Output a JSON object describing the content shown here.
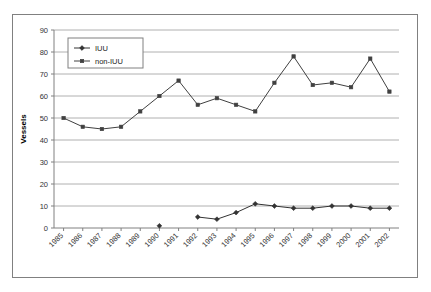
{
  "chart_data": {
    "type": "line",
    "title": "",
    "xlabel": "",
    "ylabel": "Vessels",
    "ylim": [
      0,
      90
    ],
    "ytick_step": 10,
    "yticks": [
      "0",
      "10",
      "20",
      "30",
      "40",
      "50",
      "60",
      "70",
      "80",
      "90"
    ],
    "grid": true,
    "grid_axis": "y",
    "legend_position": "top-left-inside",
    "categories": [
      "1985",
      "1986",
      "1987",
      "1988",
      "1989",
      "1990",
      "1991",
      "1992",
      "1993",
      "1994",
      "1995",
      "1996",
      "1997",
      "1998",
      "1999",
      "2000",
      "2001",
      "2002"
    ],
    "series": [
      {
        "name": "IUU",
        "marker": "diamond",
        "color": "#333333",
        "values": [
          null,
          null,
          null,
          null,
          null,
          1,
          null,
          5,
          4,
          7,
          11,
          10,
          9,
          9,
          10,
          10,
          9,
          9
        ]
      },
      {
        "name": "non-IUU",
        "marker": "square",
        "color": "#404040",
        "values": [
          50,
          46,
          45,
          46,
          53,
          60,
          67,
          56,
          59,
          56,
          53,
          66,
          78,
          65,
          66,
          64,
          77,
          62
        ]
      }
    ]
  },
  "axes": {
    "y_axis_title": "Vessels"
  },
  "legend": {
    "entries": [
      {
        "label": "IUU"
      },
      {
        "label": "non-IUU"
      }
    ]
  },
  "colors": {
    "series_iuu": "#333333",
    "series_non_iuu": "#404040",
    "grid": "#b0b0b0",
    "axis": "#808080",
    "frame": "#808080",
    "background": "#ffffff"
  }
}
